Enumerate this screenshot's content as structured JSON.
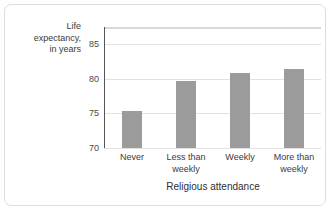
{
  "chart_data": {
    "type": "bar",
    "title": "",
    "xlabel": "Religious attendance",
    "ylabel": "Life expectancy, in years",
    "ylabel_lines": [
      "Life",
      "expectancy,",
      "in years"
    ],
    "categories": [
      "Never",
      "Less than weekly",
      "Weekly",
      "More than weekly"
    ],
    "category_lines": [
      [
        "Never"
      ],
      [
        "Less than",
        "weekly"
      ],
      [
        "Weekly"
      ],
      [
        "More than",
        "weekly"
      ]
    ],
    "values": [
      75.3,
      79.7,
      80.9,
      81.4
    ],
    "ylim": [
      70,
      87.5
    ],
    "yticks": [
      70,
      75,
      80,
      85
    ],
    "ytick_labels": [
      "70",
      "75",
      "80",
      "85"
    ],
    "grid": true,
    "legend": "none",
    "bar_color": "#9b9b9b",
    "gridline_color": "#e2e2e2",
    "axis_color": "#555555",
    "border_color": "#dddddd"
  }
}
